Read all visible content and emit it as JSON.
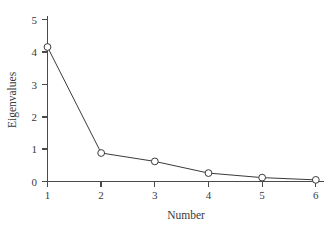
{
  "chart_data": {
    "type": "line",
    "title": "",
    "subtitle": "",
    "xlabel": "Number",
    "ylabel": "Eigenvalues",
    "x": [
      1,
      2,
      3,
      4,
      5,
      6
    ],
    "values": [
      4.15,
      0.88,
      0.62,
      0.26,
      0.12,
      0.05
    ],
    "series": [
      {
        "name": "Eigenvalues",
        "values": [
          4.15,
          0.88,
          0.62,
          0.26,
          0.12,
          0.05
        ]
      }
    ],
    "categories": [
      "1",
      "2",
      "3",
      "4",
      "5",
      "6"
    ],
    "xtick_labels": [
      "1",
      "2",
      "3",
      "4",
      "5",
      "6"
    ],
    "ytick_labels": [
      "0",
      "1",
      "2",
      "3",
      "4",
      "5"
    ],
    "ytick_values": [
      0,
      1,
      2,
      3,
      4,
      5
    ],
    "xlim": [
      0.88,
      6.12
    ],
    "ylim": [
      0,
      5.0
    ],
    "grid": false,
    "legend": false,
    "legend_position": "none",
    "marker": "open-circle",
    "line_color": "#3a3a3a",
    "marker_fill": "#ffffff",
    "axis_color": "#4a4a4a",
    "background": "#ffffff"
  },
  "axis": {
    "x_title": "Number",
    "y_title": "Eigenvalues"
  },
  "ticks": {
    "y": [
      {
        "label": "5",
        "value": 5
      },
      {
        "label": "4",
        "value": 4
      },
      {
        "label": "3",
        "value": 3
      },
      {
        "label": "2",
        "value": 2
      },
      {
        "label": "1",
        "value": 1
      },
      {
        "label": "0",
        "value": 0
      }
    ],
    "x": [
      {
        "label": "1",
        "value": 1
      },
      {
        "label": "2",
        "value": 2
      },
      {
        "label": "3",
        "value": 3
      },
      {
        "label": "4",
        "value": 4
      },
      {
        "label": "5",
        "value": 5
      },
      {
        "label": "6",
        "value": 6
      }
    ]
  }
}
